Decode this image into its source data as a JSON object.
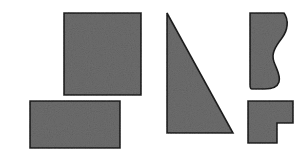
{
  "figure": {
    "background_color": "#ffffff",
    "fill_color": "#6e6e6e",
    "stroke_color": "#1d1d1d",
    "texture": "speckled-grain",
    "width": 307,
    "height": 154,
    "shape_count": 5
  },
  "shapes": [
    {
      "id": "square",
      "label": "square",
      "kind": "polygon",
      "points": "64,13 141,13 141,95 64,95",
      "bbox": {
        "x": 64,
        "y": 13,
        "width": 77,
        "height": 82
      }
    },
    {
      "id": "rectangle",
      "label": "rectangle",
      "kind": "polygon",
      "points": "30,101 120,101 120,148 30,148",
      "bbox": {
        "x": 30,
        "y": 101,
        "width": 90,
        "height": 47
      }
    },
    {
      "id": "right-triangle",
      "label": "right triangle",
      "kind": "polygon",
      "points": "167,13 233,133 167,133",
      "bbox": {
        "x": 167,
        "y": 13,
        "width": 66,
        "height": 120
      }
    },
    {
      "id": "curved-blob",
      "label": "curved hook shape",
      "kind": "path",
      "path": "M 250,13 L 284,13 C 289,20 288,30 282,38 C 275,47 271,54 274,62 C 277,70 281,76 279,82 C 277,88 271,89 265,89 L 252,89 C 250,89 250,87 250,85 Z",
      "bbox": {
        "x": 250,
        "y": 13,
        "width": 40,
        "height": 76
      }
    },
    {
      "id": "l-shape",
      "label": "L shape",
      "kind": "polygon",
      "points": "248,101 293,101 293,123 277,123 277,143 248,143",
      "bbox": {
        "x": 248,
        "y": 101,
        "width": 45,
        "height": 42
      }
    }
  ]
}
